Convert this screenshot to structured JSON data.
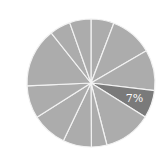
{
  "chart_data": {
    "type": "pie",
    "title": "",
    "center": [
      91,
      83
    ],
    "radius": 64,
    "start_angle_deg": 90,
    "direction": "clockwise",
    "slices": [
      {
        "label": "",
        "value": 5.8,
        "color": "#acacac"
      },
      {
        "label": "",
        "value": 10.8,
        "color": "#acacac"
      },
      {
        "label": "",
        "value": 10.3,
        "color": "#acacac"
      },
      {
        "label": "7%",
        "value": 7,
        "color": "#7a7a7a",
        "highlighted": true
      },
      {
        "label": "",
        "value": 12.1,
        "color": "#acacac"
      },
      {
        "label": "",
        "value": 3.9,
        "color": "#acacac"
      },
      {
        "label": "",
        "value": 7.2,
        "color": "#acacac"
      },
      {
        "label": "",
        "value": 8.9,
        "color": "#acacac"
      },
      {
        "label": "",
        "value": 8.3,
        "color": "#acacac"
      },
      {
        "label": "",
        "value": 15.0,
        "color": "#acacac"
      },
      {
        "label": "",
        "value": 5.3,
        "color": "#acacac"
      },
      {
        "label": "",
        "value": 5.4,
        "color": "#acacac"
      }
    ],
    "visible_labels": [
      "7%"
    ],
    "legend": "none"
  }
}
